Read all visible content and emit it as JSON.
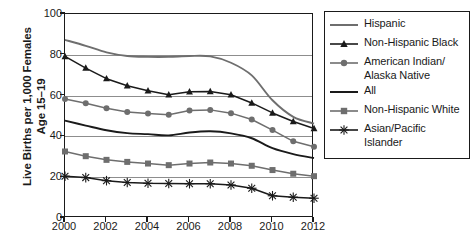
{
  "chart_data": {
    "type": "line",
    "title": "",
    "xlabel": "",
    "ylabel": "Live Births per 1,000 Females\nAge 15–19",
    "xlim": [
      2000,
      2012
    ],
    "ylim": [
      0,
      100
    ],
    "yticks": [
      0,
      20,
      40,
      60,
      80,
      100
    ],
    "xticks": [
      2000,
      2002,
      2004,
      2006,
      2008,
      2010,
      2012
    ],
    "xtick_labels": [
      "2000",
      "2002",
      "2004",
      "2006",
      "2008",
      "2010",
      "2012"
    ],
    "ytick_labels": [
      "0",
      "20",
      "40",
      "60",
      "80",
      "100"
    ],
    "grid": true,
    "legend_position": "right",
    "x": [
      2000,
      2001,
      2002,
      2003,
      2004,
      2005,
      2006,
      2007,
      2008,
      2009,
      2010,
      2011,
      2012
    ],
    "series": [
      {
        "name": "Hispanic",
        "marker": "none",
        "color": "#6e6e6e",
        "values": [
          87.3,
          84.4,
          81.2,
          79.4,
          79.0,
          79.0,
          79.4,
          79.2,
          76.1,
          69.9,
          57.7,
          49.6,
          46.3
        ]
      },
      {
        "name": "Non-Hispanic Black",
        "marker": "triangle",
        "color": "#1a1a1a",
        "values": [
          79.2,
          73.5,
          68.3,
          64.8,
          62.4,
          60.4,
          61.9,
          62.0,
          60.4,
          56.4,
          51.5,
          47.3,
          43.9
        ]
      },
      {
        "name": "American Indian/\nAlaska Native",
        "marker": "circle",
        "color": "#6e6e6e",
        "values": [
          58.3,
          56.3,
          53.8,
          52.0,
          51.2,
          50.6,
          52.7,
          53.0,
          51.4,
          48.3,
          43.1,
          37.6,
          34.9
        ]
      },
      {
        "name": "All",
        "marker": "none",
        "color": "#1a1a1a",
        "values": [
          47.7,
          45.3,
          43.0,
          41.6,
          41.1,
          40.5,
          41.9,
          42.5,
          41.5,
          39.1,
          34.2,
          31.3,
          29.4
        ]
      },
      {
        "name": "Non-Hispanic White",
        "marker": "square",
        "color": "#6e6e6e",
        "values": [
          32.6,
          30.3,
          28.5,
          27.5,
          26.7,
          25.9,
          26.7,
          27.2,
          26.7,
          25.6,
          23.5,
          21.7,
          20.5
        ]
      },
      {
        "name": "Asian/Pacific Islander",
        "marker": "asterisk",
        "color": "#1a1a1a",
        "values": [
          20.5,
          19.8,
          18.3,
          17.4,
          17.0,
          16.9,
          16.8,
          16.8,
          16.2,
          14.6,
          10.9,
          10.2,
          9.7
        ]
      }
    ]
  },
  "legend": {
    "items": [
      {
        "label": "Hispanic"
      },
      {
        "label": "Non-Hispanic Black"
      },
      {
        "label": "American Indian/\nAlaska Native"
      },
      {
        "label": "All"
      },
      {
        "label": "Non-Hispanic White"
      },
      {
        "label": "Asian/Pacific Islander"
      }
    ]
  }
}
